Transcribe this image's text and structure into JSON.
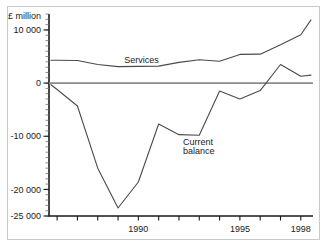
{
  "chart_data": {
    "type": "line",
    "title": "",
    "xlabel": "",
    "ylabel": "£ million",
    "ylim": [
      -25000,
      13000
    ],
    "xlim": [
      1985.6,
      1998.6
    ],
    "grid": false,
    "legend_position": "inline-labels",
    "y_ticks": [
      10000,
      0,
      -10000,
      -20000,
      -25000
    ],
    "y_tick_labels": [
      "10 000",
      "0",
      "-10 000",
      "-20 000",
      "-25 000"
    ],
    "y_minor_step": 1000,
    "x_ticks": [
      1986,
      1987,
      1988,
      1989,
      1990,
      1991,
      1992,
      1993,
      1994,
      1995,
      1996,
      1997,
      1998
    ],
    "x_tick_labels": [
      "",
      "",
      "",
      "",
      "1990",
      "",
      "",
      "",
      "",
      "1995",
      "",
      "",
      "1998"
    ],
    "annotations": [
      {
        "name": "services-label",
        "text": "Services",
        "x": 1989.3,
        "y": 3700
      },
      {
        "name": "current-balance-label-line1",
        "text": "Current",
        "x": 1992.2,
        "y": -11600
      },
      {
        "name": "current-balance-label-line2",
        "text": "balance",
        "x": 1992.2,
        "y": -13400
      }
    ],
    "series": [
      {
        "name": "Services",
        "x": [
          1985.7,
          1986,
          1987,
          1988,
          1989,
          1990,
          1991,
          1992,
          1993,
          1994,
          1995,
          1996,
          1997,
          1998,
          1998.5
        ],
        "values": [
          4300,
          4300,
          4250,
          3500,
          3100,
          3150,
          3200,
          3900,
          4400,
          4100,
          5400,
          5450,
          7200,
          9100,
          11900
        ]
      },
      {
        "name": "Current balance",
        "x": [
          1985.7,
          1986,
          1987,
          1988,
          1989,
          1990,
          1991,
          1992,
          1993,
          1994,
          1995,
          1996,
          1997,
          1998,
          1998.5
        ],
        "values": [
          -300,
          -1200,
          -4300,
          -16000,
          -23500,
          -18600,
          -7700,
          -9700,
          -9800,
          -1500,
          -3000,
          -1400,
          3500,
          1300,
          1500
        ]
      }
    ]
  },
  "figure": {
    "axis_label": "£ million",
    "series_labels": {
      "services": "Services",
      "current_balance_line1": "Current",
      "current_balance_line2": "balance"
    }
  }
}
